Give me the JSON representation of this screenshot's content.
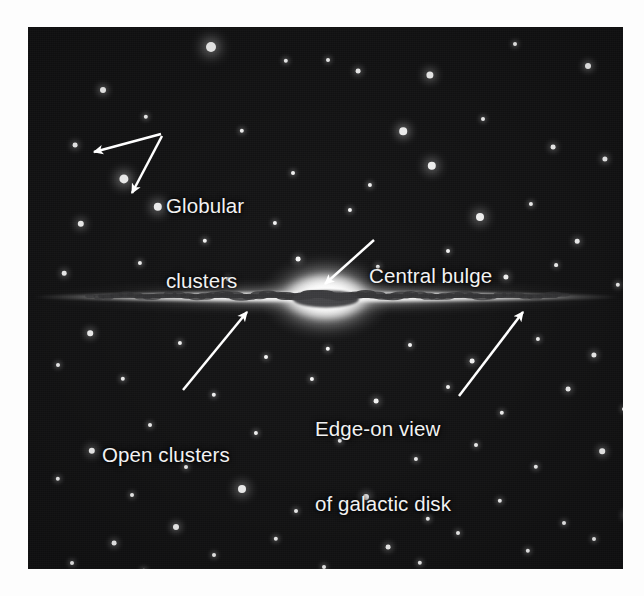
{
  "figure": {
    "kind": "astronomy-diagram",
    "background_color": "#ffffff",
    "plate_color": "#0d0d0e",
    "label_color": "#f2f2f2",
    "arrow_color": "#ffffff"
  },
  "labels": {
    "globular_clusters": {
      "line1": "Globular",
      "line2": "clusters"
    },
    "central_bulge": {
      "line1": "Central bulge"
    },
    "open_clusters": {
      "line1": "Open clusters"
    },
    "edge_on_view": {
      "line1": "Edge-on view",
      "line2": "of galactic disk"
    }
  },
  "annotations": [
    {
      "name": "globular-clusters",
      "text": "Globular clusters",
      "arrows": 2
    },
    {
      "name": "central-bulge",
      "text": "Central bulge",
      "arrows": 1
    },
    {
      "name": "open-clusters",
      "text": "Open clusters",
      "arrows": 1
    },
    {
      "name": "edge-on-view-of-galactic-disk",
      "text": "Edge-on view of galactic disk",
      "arrows": 1
    }
  ],
  "galaxy": {
    "disk_label": "galactic disk",
    "bulge_label": "central bulge",
    "dust_lane_label": "dust lane"
  },
  "stars": [
    [
      183,
      20,
      5.0
    ],
    [
      258,
      34,
      2.2
    ],
    [
      75,
      63,
      3.0
    ],
    [
      330,
      44,
      2.4
    ],
    [
      402,
      48,
      3.6
    ],
    [
      560,
      39,
      3.0
    ],
    [
      487,
      17,
      2.0
    ],
    [
      612,
      78,
      3.1
    ],
    [
      118,
      90,
      2.2
    ],
    [
      214,
      104,
      2.2
    ],
    [
      47,
      118,
      2.4
    ],
    [
      300,
      33,
      2.0
    ],
    [
      375,
      104,
      3.8
    ],
    [
      455,
      92,
      2.0
    ],
    [
      525,
      120,
      2.4
    ],
    [
      96,
      152,
      4.6
    ],
    [
      130,
      180,
      4.2
    ],
    [
      265,
      146,
      2.0
    ],
    [
      342,
      158,
      2.1
    ],
    [
      404,
      139,
      4.2
    ],
    [
      577,
      132,
      2.6
    ],
    [
      610,
      170,
      2.2
    ],
    [
      53,
      197,
      3.2
    ],
    [
      177,
      214,
      2.2
    ],
    [
      247,
      196,
      2.1
    ],
    [
      322,
      183,
      2.1
    ],
    [
      452,
      190,
      4.0
    ],
    [
      503,
      177,
      2.1
    ],
    [
      549,
      214,
      2.3
    ],
    [
      613,
      228,
      3.0
    ],
    [
      36,
      246,
      2.3
    ],
    [
      112,
      236,
      2.1
    ],
    [
      200,
      252,
      2.0
    ],
    [
      270,
      232,
      2.4
    ],
    [
      350,
      240,
      2.2
    ],
    [
      420,
      224,
      2.0
    ],
    [
      478,
      250,
      2.6
    ],
    [
      528,
      238,
      1.9
    ],
    [
      590,
      258,
      2.2
    ],
    [
      621,
      205,
      2.0
    ],
    [
      62,
      306,
      2.8
    ],
    [
      152,
      316,
      2.1
    ],
    [
      238,
      330,
      2.0
    ],
    [
      300,
      322,
      2.2
    ],
    [
      382,
      318,
      2.0
    ],
    [
      444,
      334,
      2.4
    ],
    [
      510,
      312,
      2.1
    ],
    [
      566,
      328,
      2.6
    ],
    [
      612,
      300,
      2.0
    ],
    [
      30,
      338,
      2.0
    ],
    [
      95,
      352,
      2.2
    ],
    [
      186,
      368,
      2.2
    ],
    [
      284,
      352,
      2.1
    ],
    [
      348,
      374,
      2.4
    ],
    [
      420,
      360,
      2.0
    ],
    [
      474,
      386,
      2.2
    ],
    [
      540,
      362,
      2.4
    ],
    [
      596,
      382,
      2.0
    ],
    [
      122,
      398,
      2.0
    ],
    [
      228,
      406,
      2.1
    ],
    [
      64,
      424,
      3.2
    ],
    [
      158,
      440,
      2.0
    ],
    [
      312,
      414,
      2.2
    ],
    [
      388,
      432,
      2.1
    ],
    [
      448,
      418,
      2.0
    ],
    [
      508,
      440,
      2.2
    ],
    [
      574,
      424,
      2.8
    ],
    [
      620,
      452,
      2.1
    ],
    [
      30,
      452,
      2.2
    ],
    [
      104,
      468,
      2.0
    ],
    [
      214,
      462,
      4.0
    ],
    [
      268,
      484,
      2.0
    ],
    [
      338,
      470,
      3.0
    ],
    [
      400,
      492,
      2.2
    ],
    [
      472,
      474,
      2.2
    ],
    [
      536,
      496,
      2.0
    ],
    [
      598,
      488,
      2.4
    ],
    [
      148,
      500,
      3.0
    ],
    [
      86,
      516,
      2.4
    ],
    [
      248,
      512,
      2.2
    ],
    [
      186,
      528,
      2.0
    ],
    [
      360,
      520,
      2.4
    ],
    [
      430,
      506,
      2.0
    ],
    [
      500,
      524,
      2.2
    ],
    [
      566,
      512,
      2.0
    ],
    [
      616,
      534,
      2.2
    ],
    [
      44,
      536,
      2.0
    ],
    [
      116,
      544,
      2.2
    ],
    [
      296,
      540,
      2.0
    ],
    [
      392,
      536,
      2.2
    ]
  ]
}
